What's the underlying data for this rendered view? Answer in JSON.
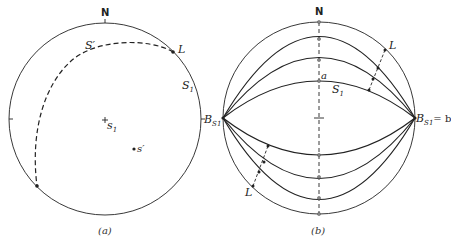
{
  "figure": {
    "panels": [
      {
        "id": "a",
        "caption": "(a)",
        "labels": {
          "north": "N",
          "s_prime_plane": "S′",
          "lineation": "L",
          "s1_plane": "S",
          "s1_plane_sub": "1",
          "bs1": "B",
          "bs1_sub": "S1",
          "pole_s1": "s",
          "pole_s1_sub": "1",
          "pole_s_prime": "s′"
        }
      },
      {
        "id": "b",
        "caption": "(b)",
        "labels": {
          "north": "N",
          "lineation_top": "L",
          "lineation_bottom": "L",
          "a_axis": "a",
          "s1_plane": "S",
          "s1_plane_sub": "1",
          "bs1": "B",
          "bs1_sub": "S1",
          "bs1_eq": "= b"
        }
      }
    ],
    "colors": {
      "line": "#222222",
      "background": "#ffffff",
      "dot": "#888888"
    }
  }
}
